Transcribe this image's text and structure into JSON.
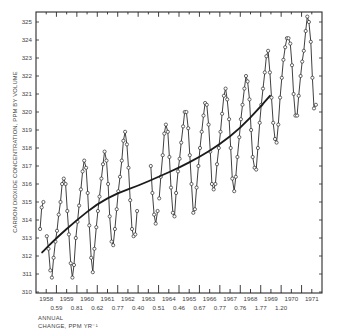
{
  "chart_data": {
    "type": "line",
    "title": "",
    "ylabel": "CARBON DIOXIDE CONCENTRATION, PPM BY VOLUME",
    "xlabel": "",
    "ylim": [
      310,
      325.5
    ],
    "xlim": [
      1958,
      1972
    ],
    "y_ticks": [
      310,
      311,
      312,
      313,
      314,
      315,
      316,
      317,
      318,
      319,
      320,
      321,
      322,
      323,
      324,
      325
    ],
    "x_tick_labels": [
      "1958",
      "1959",
      "1960",
      "1961",
      "1962",
      "1963",
      "1964",
      "1965",
      "1966",
      "1967",
      "1968",
      "1969",
      "1970",
      "1971"
    ],
    "annual_change_label": "ANNUAL",
    "annual_change_label2": "CHANGE, PPM YR⁻¹",
    "annual_change": [
      {
        "between": "1958-1959",
        "value": "0.59"
      },
      {
        "between": "1959-1960",
        "value": "0.81"
      },
      {
        "between": "1960-1961",
        "value": "0.62"
      },
      {
        "between": "1961-1962",
        "value": "0.77"
      },
      {
        "between": "1962-1963",
        "value": "0.40"
      },
      {
        "between": "1963-1964",
        "value": "0.51"
      },
      {
        "between": "1964-1965",
        "value": "0.46"
      },
      {
        "between": "1965-1966",
        "value": "0.67"
      },
      {
        "between": "1966-1967",
        "value": "0.77"
      },
      {
        "between": "1967-1968",
        "value": "0.76"
      },
      {
        "between": "1968-1969",
        "value": "1.77"
      },
      {
        "between": "1969-1970",
        "value": "1.20"
      }
    ],
    "series": [
      {
        "name": "Monthly mean CO2 (Mauna Loa)",
        "style": "line-with-open-circles",
        "segments": [
          [
            [
              1958.2,
              313.5
            ],
            [
              1958.28,
              314.7
            ],
            [
              1958.36,
              315.0
            ]
          ],
          [
            [
              1958.53,
              313.1
            ],
            [
              1958.61,
              312.4
            ],
            [
              1958.7,
              311.2
            ]
          ],
          [
            [
              1958.78,
              310.8
            ],
            [
              1958.86,
              311.9
            ],
            [
              1958.95,
              312.8
            ],
            [
              1959.03,
              313.4
            ],
            [
              1959.11,
              314.3
            ],
            [
              1959.2,
              315.0
            ],
            [
              1959.28,
              316.0
            ],
            [
              1959.36,
              316.3
            ],
            [
              1959.45,
              316.0
            ],
            [
              1959.53,
              314.5
            ],
            [
              1959.61,
              313.2
            ],
            [
              1959.7,
              311.6
            ],
            [
              1959.78,
              310.8
            ],
            [
              1959.86,
              311.5
            ],
            [
              1959.95,
              313.0
            ],
            [
              1960.03,
              313.9
            ],
            [
              1960.11,
              314.8
            ],
            [
              1960.2,
              315.7
            ],
            [
              1960.28,
              316.7
            ],
            [
              1960.36,
              317.3
            ],
            [
              1960.45,
              316.9
            ],
            [
              1960.53,
              315.5
            ],
            [
              1960.61,
              313.7
            ],
            [
              1960.7,
              311.9
            ],
            [
              1960.78,
              311.1
            ],
            [
              1960.86,
              312.4
            ],
            [
              1960.95,
              313.6
            ],
            [
              1961.03,
              314.5
            ],
            [
              1961.11,
              315.3
            ],
            [
              1961.2,
              316.3
            ],
            [
              1961.28,
              317.1
            ],
            [
              1961.36,
              317.8
            ],
            [
              1961.45,
              317.3
            ],
            [
              1961.53,
              316.0
            ],
            [
              1961.61,
              314.2
            ],
            [
              1961.7,
              312.8
            ],
            [
              1961.78,
              312.6
            ],
            [
              1961.86,
              313.5
            ],
            [
              1961.95,
              314.6
            ],
            [
              1962.03,
              315.6
            ],
            [
              1962.11,
              316.4
            ],
            [
              1962.2,
              317.3
            ],
            [
              1962.28,
              318.4
            ],
            [
              1962.36,
              318.9
            ],
            [
              1962.45,
              318.2
            ],
            [
              1962.53,
              316.9
            ],
            [
              1962.61,
              315.1
            ],
            [
              1962.7,
              313.5
            ],
            [
              1962.78,
              313.1
            ],
            [
              1962.86,
              313.2
            ],
            [
              1962.95,
              314.5
            ]
          ],
          [
            [
              1963.62,
              317.0
            ],
            [
              1963.7,
              315.5
            ],
            [
              1963.78,
              314.3
            ],
            [
              1963.86,
              313.8
            ],
            [
              1963.95,
              314.5
            ]
          ],
          [
            [
              1964.03,
              315.2
            ],
            [
              1964.11,
              316.4
            ],
            [
              1964.2,
              317.6
            ],
            [
              1964.28,
              318.8
            ],
            [
              1964.36,
              319.3
            ],
            [
              1964.45,
              318.9
            ],
            [
              1964.53,
              317.5
            ],
            [
              1964.61,
              315.8
            ],
            [
              1964.7,
              314.4
            ],
            [
              1964.78,
              314.2
            ],
            [
              1964.86,
              315.5
            ],
            [
              1964.95,
              316.7
            ],
            [
              1965.03,
              317.4
            ],
            [
              1965.11,
              318.3
            ],
            [
              1965.2,
              319.2
            ],
            [
              1965.28,
              320.0
            ],
            [
              1965.36,
              320.0
            ],
            [
              1965.45,
              319.1
            ],
            [
              1965.53,
              317.6
            ],
            [
              1965.61,
              316.0
            ],
            [
              1965.7,
              314.4
            ],
            [
              1965.78,
              314.6
            ],
            [
              1965.86,
              315.8
            ],
            [
              1965.95,
              317.0
            ],
            [
              1966.03,
              318.0
            ],
            [
              1966.11,
              318.9
            ],
            [
              1966.2,
              319.8
            ],
            [
              1966.28,
              320.5
            ],
            [
              1966.36,
              320.4
            ],
            [
              1966.45,
              319.3
            ],
            [
              1966.53,
              317.8
            ],
            [
              1966.61,
              316.0
            ],
            [
              1966.7,
              315.7
            ],
            [
              1966.78,
              316.0
            ],
            [
              1966.86,
              317.1
            ],
            [
              1966.95,
              318.0
            ],
            [
              1967.03,
              318.9
            ],
            [
              1967.11,
              319.9
            ],
            [
              1967.2,
              320.9
            ],
            [
              1967.28,
              321.3
            ],
            [
              1967.36,
              320.7
            ],
            [
              1967.45,
              319.6
            ],
            [
              1967.53,
              318.0
            ],
            [
              1967.61,
              316.3
            ],
            [
              1967.7,
              315.6
            ],
            [
              1967.78,
              316.4
            ],
            [
              1967.86,
              317.5
            ],
            [
              1967.95,
              318.6
            ],
            [
              1968.03,
              319.6
            ],
            [
              1968.11,
              320.4
            ],
            [
              1968.2,
              321.3
            ],
            [
              1968.28,
              322.0
            ],
            [
              1968.36,
              321.7
            ],
            [
              1968.45,
              320.7
            ],
            [
              1968.53,
              319.0
            ],
            [
              1968.61,
              317.5
            ],
            [
              1968.7,
              316.9
            ],
            [
              1968.78,
              316.8
            ],
            [
              1968.86,
              318.0
            ],
            [
              1968.95,
              319.4
            ],
            [
              1969.03,
              320.4
            ],
            [
              1969.11,
              321.3
            ],
            [
              1969.2,
              322.2
            ],
            [
              1969.28,
              323.1
            ],
            [
              1969.36,
              323.4
            ],
            [
              1969.45,
              322.2
            ],
            [
              1969.53,
              320.8
            ],
            [
              1969.61,
              319.4
            ],
            [
              1969.7,
              318.5
            ],
            [
              1969.78,
              318.3
            ],
            [
              1969.86,
              319.3
            ],
            [
              1969.95,
              320.8
            ],
            [
              1970.03,
              321.9
            ],
            [
              1970.11,
              322.9
            ],
            [
              1970.2,
              323.6
            ],
            [
              1970.28,
              324.1
            ],
            [
              1970.36,
              324.1
            ],
            [
              1970.45,
              323.8
            ],
            [
              1970.53,
              322.6
            ],
            [
              1970.61,
              321.0
            ],
            [
              1970.7,
              319.8
            ],
            [
              1970.78,
              319.8
            ],
            [
              1970.86,
              320.9
            ],
            [
              1970.95,
              322.0
            ],
            [
              1971.03,
              322.8
            ],
            [
              1971.11,
              323.4
            ],
            [
              1971.2,
              324.5
            ],
            [
              1971.28,
              325.3
            ],
            [
              1971.36,
              325.0
            ],
            [
              1971.45,
              323.9
            ],
            [
              1971.53,
              321.9
            ],
            [
              1971.61,
              320.2
            ],
            [
              1971.7,
              320.4
            ]
          ]
        ]
      },
      {
        "name": "Smoothed trend",
        "style": "thick-line",
        "points": [
          [
            1958.3,
            312.2
          ],
          [
            1959.0,
            313.0
          ],
          [
            1960.0,
            314.0
          ],
          [
            1961.0,
            314.9
          ],
          [
            1962.0,
            315.5
          ],
          [
            1963.0,
            315.9
          ],
          [
            1964.0,
            316.4
          ],
          [
            1965.0,
            316.9
          ],
          [
            1966.0,
            317.5
          ],
          [
            1967.0,
            318.2
          ],
          [
            1968.0,
            319.1
          ],
          [
            1969.0,
            320.3
          ],
          [
            1969.45,
            320.9
          ]
        ]
      }
    ]
  }
}
